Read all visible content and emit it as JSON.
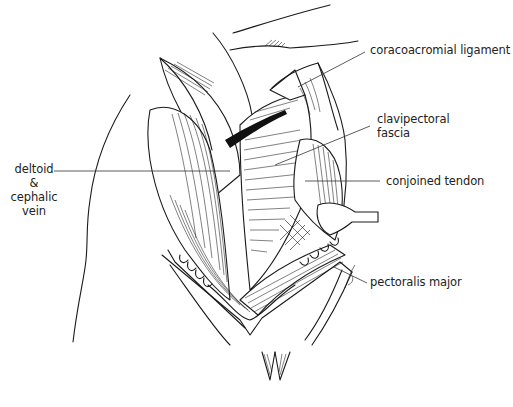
{
  "figure": {
    "labels": {
      "coracoacromial": "coracoacromial ligament",
      "clavipectoral_1": "clavipectoral",
      "clavipectoral_2": "fascia",
      "conjoined": "conjoined tendon",
      "deltoid_1": "deltoid",
      "deltoid_2": "&",
      "deltoid_3": "cephalic",
      "deltoid_4": "vein",
      "pectoralis": "pectoralis major"
    },
    "signature": "artist-signature",
    "colors": {
      "ink": "#1a1a1a",
      "background": "#ffffff"
    }
  }
}
